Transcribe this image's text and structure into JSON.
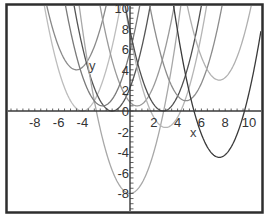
{
  "chart_data": {
    "type": "line",
    "title": "",
    "xlabel": "x",
    "ylabel": "y",
    "xlim": [
      -10,
      10
    ],
    "ylim": [
      -10,
      10
    ],
    "grid": false,
    "legend": null,
    "x_ticks": [
      -8,
      -6,
      -4,
      2,
      4,
      6,
      8,
      10
    ],
    "y_ticks": [
      10,
      8,
      6,
      4,
      2,
      0,
      -2,
      -4,
      -6,
      -8
    ],
    "x_tick_labels": [
      "-8",
      "-6",
      "-4",
      "2",
      "4",
      "6",
      "8",
      "10"
    ],
    "y_tick_labels": [
      "10",
      "8",
      "6",
      "4",
      "2",
      "0",
      "-2",
      "-4",
      "-6",
      "-8"
    ],
    "series": [
      {
        "name": "parabola-1",
        "form": "y=(x-h)^2+k",
        "h": -4.0,
        "k": 0.0,
        "color": "#bdbdbd"
      },
      {
        "name": "parabola-2",
        "form": "y=(x-h)^2+k",
        "h": -4.5,
        "k": 4.0,
        "color": "#8a8a8a"
      },
      {
        "name": "parabola-3",
        "form": "y=(x-h)^2+k",
        "h": -1.5,
        "k": 0.0,
        "color": "#555555"
      },
      {
        "name": "parabola-4",
        "form": "y=(x-h)^2+k",
        "h": 0.0,
        "k": -8.0,
        "color": "#a8a8a8"
      },
      {
        "name": "parabola-5",
        "form": "y=(x-h)^2+k",
        "h": 0.6,
        "k": 0.5,
        "color": "#9a9a9a"
      },
      {
        "name": "parabola-6",
        "form": "y=(x-h)^2+k",
        "h": -2.3,
        "k": 0.5,
        "color": "#7a7a7a"
      },
      {
        "name": "parabola-7",
        "form": "y=(x-h)^2+k",
        "h": 3.0,
        "k": -1.6,
        "color": "#b5b5b5"
      },
      {
        "name": "parabola-8",
        "form": "y=(x-h)^2+k",
        "h": 2.8,
        "k": 0.0,
        "color": "#505050"
      },
      {
        "name": "parabola-9",
        "form": "y=(x-h)^2+k",
        "h": 4.7,
        "k": 1.0,
        "color": "#8c8c8c"
      },
      {
        "name": "parabola-10",
        "form": "y=(x-h)^2+k",
        "h": 7.5,
        "k": 3.0,
        "color": "#b0b0b0"
      },
      {
        "name": "parabola-11",
        "form": "y=(x-h)^2+k",
        "h": 7.5,
        "k": -4.5,
        "color": "#3a3a3a"
      }
    ]
  },
  "labels": {
    "x_axis": "x",
    "y_axis": "y"
  }
}
